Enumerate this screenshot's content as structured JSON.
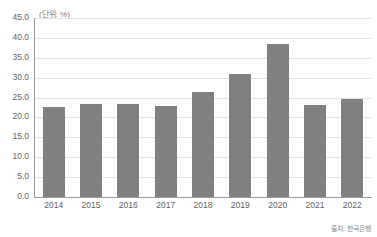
{
  "chart_data": {
    "type": "bar",
    "title": "",
    "subtitle": "",
    "unit_label": "(단위: %)",
    "xlabel": "",
    "ylabel": "",
    "categories": [
      "2014",
      "2015",
      "2016",
      "2017",
      "2018",
      "2019",
      "2020",
      "2021",
      "2022"
    ],
    "values": [
      22.7,
      23.4,
      23.4,
      23.0,
      26.5,
      31.0,
      38.5,
      23.2,
      24.6
    ],
    "ylim": [
      0.0,
      45.0
    ],
    "ytick_labels": [
      "45.0",
      "40.0",
      "35.0",
      "30.0",
      "25.0",
      "20.0",
      "15.0",
      "10.0",
      "5.0",
      "0.0"
    ],
    "ytick_values": [
      45.0,
      40.0,
      35.0,
      30.0,
      25.0,
      20.0,
      15.0,
      10.0,
      5.0,
      0.0
    ],
    "grid": true,
    "legend": false,
    "legend_position": "none",
    "series": [
      {
        "name": "value",
        "values": [
          22.7,
          23.4,
          23.4,
          23.0,
          26.5,
          31.0,
          38.5,
          23.2,
          24.6
        ]
      }
    ],
    "colors": {
      "bar": "#808080",
      "gridline": "#e2e2e2",
      "axis": "#9a9a9a",
      "text": "#5f5f5f",
      "background": "#ffffff"
    }
  },
  "source_note": "출처: 한국은행"
}
